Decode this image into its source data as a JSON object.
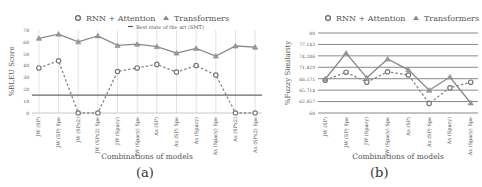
{
  "chart_data": [
    {
      "type": "line",
      "panel": "(a)",
      "title": "",
      "xlabel": "Combinations of models",
      "ylabel": "%BLEU Score",
      "ylim": [
        0,
        70
      ],
      "yticks": [
        0,
        10,
        20,
        30,
        40,
        50,
        60,
        70
      ],
      "grid": "vertical",
      "legend_position": "top",
      "categories": [
        "JW (SP)",
        "JW (SP) Spe",
        "JW (SPx2)",
        "JW (SPx2) Spe",
        "JW (Spacy)",
        "JW (Spacy) Spe",
        "Ax (SP)",
        "Ax (SP) Spe",
        "Ax (Spacy)",
        "Ax (Spacy) Spe",
        "Ax (SPx2)",
        "Ax (SPx2) Spe"
      ],
      "series": [
        {
          "name": "RNN + Attention",
          "style": "dashed",
          "marker": "circle",
          "values": [
            38,
            44,
            0,
            0,
            35,
            38,
            41,
            34.5,
            40,
            32,
            0,
            0
          ]
        },
        {
          "name": "Transformers",
          "style": "solid",
          "marker": "triangle",
          "values": [
            63,
            66.5,
            60,
            65,
            57,
            58,
            56,
            50.5,
            54.5,
            48,
            56.5,
            55.5
          ]
        },
        {
          "name": "Best state of the art (SMT)",
          "style": "solid",
          "marker": "none",
          "values": [
            15,
            15,
            15,
            15,
            15,
            15,
            15,
            15,
            15,
            15,
            15,
            15
          ]
        }
      ]
    },
    {
      "type": "line",
      "panel": "(b)",
      "title": "",
      "xlabel": "Combinations of models",
      "ylabel": "%Fuzzy Similarity",
      "ylim": [
        60,
        80
      ],
      "yticks": [
        "60",
        "62.857",
        "65.714",
        "68.571",
        "71.429",
        "74.286",
        "77.143",
        "80"
      ],
      "grid": "horizontal",
      "legend_position": "top",
      "categories": [
        "JW (SP)",
        "JW (SP) Spe",
        "JW (Spacy)",
        "JW (Spacy) Spe",
        "Ax (SP)",
        "Ax (SP) Spe",
        "Ax (Spacy)",
        "Ax (Spacy) Spe"
      ],
      "series": [
        {
          "name": "RNN + Attention",
          "style": "dashed",
          "marker": "circle",
          "values": [
            68.2,
            70.2,
            67.7,
            70.3,
            69.5,
            62.4,
            66.3,
            67.7
          ]
        },
        {
          "name": "Transformers",
          "style": "solid",
          "marker": "triangle",
          "values": [
            68.5,
            75,
            68.8,
            73.5,
            70.8,
            65.7,
            69,
            62.5
          ]
        }
      ]
    }
  ],
  "captions": {
    "a": "(a)",
    "b": "(b)"
  },
  "legend": {
    "rnn": "RNN + Attention",
    "transformers": "Transformers",
    "smt": "Best state of the art (SMT)"
  }
}
